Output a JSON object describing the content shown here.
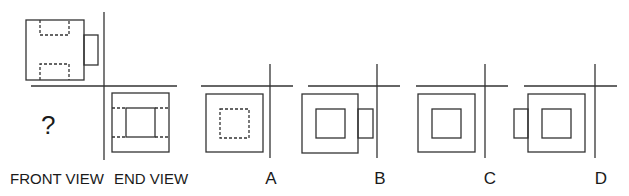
{
  "question": {
    "mark": "?",
    "front_label": "FRONT VIEW",
    "end_label": "END VIEW"
  },
  "options": [
    {
      "letter": "A"
    },
    {
      "letter": "B"
    },
    {
      "letter": "C"
    },
    {
      "letter": "D"
    }
  ],
  "colors": {
    "stroke": "#333333",
    "text": "#1a1a1a",
    "background": "#ffffff"
  }
}
